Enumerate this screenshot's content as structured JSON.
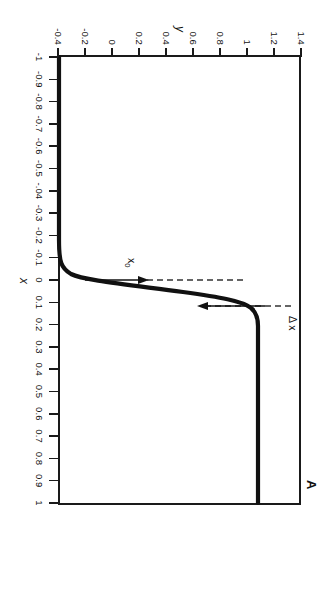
{
  "figure": {
    "panel_letter": "A",
    "axis_titles": {
      "x": "x",
      "y": "y"
    },
    "annotations": {
      "delta_x": "Δ x",
      "x0": "x",
      "x0_sub": "0"
    }
  },
  "chart_data": {
    "type": "line",
    "title": "A",
    "xlabel": "x",
    "ylabel": "y",
    "xlim": [
      -1,
      1
    ],
    "ylim": [
      -0.4,
      1.4
    ],
    "grid": false,
    "legend": "none",
    "x_ticks": [
      -1,
      -0.9,
      -0.8,
      -0.7,
      -0.6,
      -0.5,
      -0.4,
      -0.3,
      -0.2,
      -0.1,
      0,
      0.1,
      0.2,
      0.3,
      0.4,
      0.5,
      0.6,
      0.7,
      0.8,
      0.9,
      1
    ],
    "x_tick_labels": [
      "-1",
      "-0.9",
      "-0.8",
      "-0.7",
      "-0.6",
      "-0.5",
      "-.04",
      "-0.3",
      "-0.2",
      "-0.1",
      "0",
      "0.1",
      "0.2",
      "0.3",
      "0.4",
      "0.5",
      "0.6",
      "0.7",
      "0.8",
      "0.9",
      "1"
    ],
    "y_ticks": [
      -0.4,
      -0.2,
      0,
      0.2,
      0.4,
      0.6,
      0.8,
      1,
      1.2,
      1.4
    ],
    "y_tick_labels": [
      "-0.4",
      "-0.2",
      "0",
      "0.2",
      "0.4",
      "0.6",
      "0.8",
      "1",
      "1.2",
      "1.4"
    ],
    "series": [
      {
        "name": "step transition",
        "description": "Smoothed unit step (sigmoid) rising from y=0 for x<0 to y=1 for x>0.12",
        "x": [
          -1.0,
          -0.9,
          -0.8,
          -0.7,
          -0.6,
          -0.5,
          -0.4,
          -0.3,
          -0.2,
          -0.15,
          -0.1,
          -0.05,
          -0.02,
          0.0,
          0.02,
          0.04,
          0.06,
          0.08,
          0.1,
          0.11,
          0.12,
          0.14,
          0.2,
          0.3,
          0.4,
          0.5,
          0.6,
          0.7,
          0.8,
          0.9,
          1.0
        ],
        "y": [
          0.0,
          0.0,
          0.0,
          0.0,
          0.0,
          0.0,
          0.0,
          0.0,
          0.0,
          0.0,
          0.0,
          0.01,
          0.03,
          0.07,
          0.14,
          0.27,
          0.45,
          0.65,
          0.86,
          0.93,
          0.97,
          1.0,
          1.0,
          1.0,
          1.0,
          1.0,
          1.0,
          1.0,
          1.0,
          1.0,
          1.0
        ]
      }
    ],
    "guide_lines": [
      {
        "name": "x0-dashed",
        "orientation": "vertical",
        "x": 0.0,
        "style": "dashed"
      },
      {
        "name": "delta-x-dashed",
        "orientation": "vertical",
        "x": 0.115,
        "style": "dashed"
      }
    ],
    "arrows": [
      {
        "name": "delta-x-arrow",
        "label": "Δ x",
        "points_to_x": 0.115
      },
      {
        "name": "x0-arrow",
        "label": "x0",
        "points_to_x": 0.0
      }
    ]
  }
}
